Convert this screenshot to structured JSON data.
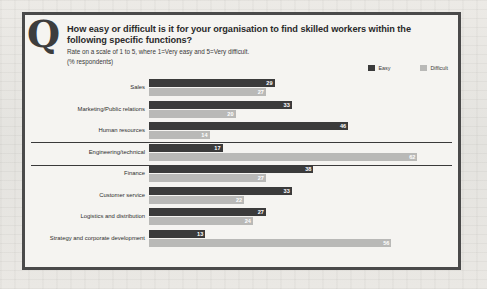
{
  "marker": "Q",
  "header": {
    "title": "How easy or difficult is it for your organisation to find skilled workers within the following specific functions?",
    "subtitle": "Rate on a scale of 1 to 5, where 1=Very easy and 5=Very difficult.",
    "units": "(% respondents)"
  },
  "legend": {
    "easy_label": "Easy",
    "difficult_label": "Difficult",
    "easy_color": "#3b3b3b",
    "difficult_color": "#b9b9b7"
  },
  "chart_data": {
    "type": "bar",
    "orientation": "horizontal",
    "title": "How easy or difficult is it for your organisation to find skilled workers within the following specific functions?",
    "subtitle": "Rate on a scale of 1 to 5, where 1=Very easy and 5=Very difficult.",
    "xlabel": "",
    "ylabel": "",
    "units": "% respondents",
    "xlim": [
      0,
      70
    ],
    "grid": false,
    "legend_position": "top-right",
    "categories": [
      "Sales",
      "Marketing/Public relations",
      "Human resources",
      "Engineering/technical",
      "Finance",
      "Customer service",
      "Logistics and distribution",
      "Strategy and corporate development"
    ],
    "series": [
      {
        "name": "Easy",
        "values": [
          29,
          33,
          46,
          17,
          38,
          33,
          27,
          13
        ]
      },
      {
        "name": "Difficult",
        "values": [
          27,
          20,
          14,
          62,
          27,
          22,
          24,
          56
        ]
      }
    ],
    "highlighted_category": "Engineering/technical"
  },
  "rows": [
    {
      "label": "Sales",
      "easy": "29",
      "difficult": "27",
      "easy_w": 29,
      "diff_w": 27
    },
    {
      "label": "Marketing/Public relations",
      "easy": "33",
      "difficult": "20",
      "easy_w": 33,
      "diff_w": 20
    },
    {
      "label": "Human resources",
      "easy": "46",
      "difficult": "14",
      "easy_w": 46,
      "diff_w": 14
    },
    {
      "label": "Engineering/technical",
      "easy": "17",
      "difficult": "62",
      "easy_w": 17,
      "diff_w": 62
    },
    {
      "label": "Finance",
      "easy": "38",
      "difficult": "27",
      "easy_w": 38,
      "diff_w": 27
    },
    {
      "label": "Customer service",
      "easy": "33",
      "difficult": "22",
      "easy_w": 33,
      "diff_w": 22
    },
    {
      "label": "Logistics and distribution",
      "easy": "27",
      "difficult": "24",
      "easy_w": 27,
      "diff_w": 24
    },
    {
      "label": "Strategy and corporate development",
      "easy": "13",
      "difficult": "56",
      "easy_w": 13,
      "diff_w": 56
    }
  ]
}
